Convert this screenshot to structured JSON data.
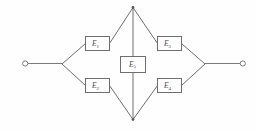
{
  "diagram": {
    "type": "bridge-network",
    "background_color": "#fefefe",
    "line_color": "#6e6e6e",
    "box_fill": "#ffffff",
    "label_color": "#4a4a4a",
    "components": [
      {
        "id": "E1",
        "base": "E",
        "subscript": "1",
        "label": "E1",
        "x": 85,
        "y": 36,
        "w": 25,
        "h": 15,
        "position": "upper-left"
      },
      {
        "id": "E2",
        "base": "E",
        "subscript": "2",
        "label": "E2",
        "x": 85,
        "y": 78,
        "w": 25,
        "h": 15,
        "position": "lower-left"
      },
      {
        "id": "E3",
        "base": "E",
        "subscript": "3",
        "label": "E3",
        "x": 157,
        "y": 36,
        "w": 25,
        "h": 15,
        "position": "upper-right"
      },
      {
        "id": "E4",
        "base": "E",
        "subscript": "4",
        "label": "E4",
        "x": 157,
        "y": 78,
        "w": 25,
        "h": 15,
        "position": "lower-right"
      },
      {
        "id": "E5",
        "base": "E",
        "subscript": "5",
        "label": "E5",
        "x": 119,
        "y": 56,
        "w": 25,
        "h": 17,
        "position": "center-bridge"
      }
    ],
    "terminals": [
      {
        "id": "left-terminal",
        "x": 25,
        "y": 63,
        "r": 2.6
      },
      {
        "id": "right-terminal",
        "x": 243,
        "y": 63,
        "r": 2.6
      }
    ],
    "nodes": [
      {
        "id": "left-node",
        "x": 62,
        "y": 64
      },
      {
        "id": "right-node",
        "x": 205,
        "y": 64
      },
      {
        "id": "top-node",
        "x": 133,
        "y": 7
      },
      {
        "id": "bottom-node",
        "x": 133,
        "y": 120
      }
    ],
    "leads": [
      {
        "id": "left-lead",
        "x1": 28,
        "y1": 63.5,
        "x2": 62,
        "y2": 63.5
      },
      {
        "id": "right-lead",
        "x1": 205,
        "y1": 63.5,
        "x2": 240,
        "y2": 63.5
      }
    ],
    "branches": [
      {
        "id": "branch-left-to-e1",
        "points": "62,64 85,43.5"
      },
      {
        "id": "branch-e1-to-top",
        "points": "110,43.5 133,7"
      },
      {
        "id": "branch-top-to-e3",
        "points": "133,7 157,43.5"
      },
      {
        "id": "branch-e3-to-right",
        "points": "182,43.5 205,64"
      },
      {
        "id": "branch-left-to-e2",
        "points": "62,64 85,85.5"
      },
      {
        "id": "branch-e2-to-bottom",
        "points": "110,85.5 133,120"
      },
      {
        "id": "branch-bottom-to-e4",
        "points": "133,120 157,85.5"
      },
      {
        "id": "branch-e4-to-right",
        "points": "182,85.5 205,64"
      },
      {
        "id": "bridge-top-to-e5",
        "points": "133,7 133,56"
      },
      {
        "id": "bridge-e5-to-bottom",
        "points": "133,73 133,120"
      }
    ]
  }
}
